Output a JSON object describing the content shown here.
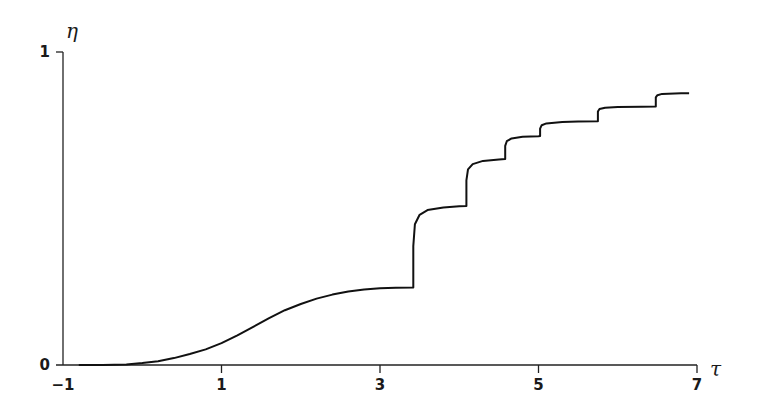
{
  "chart_data": {
    "type": "line",
    "title": "",
    "xlabel": "τ",
    "ylabel": "η",
    "xlim": [
      -1,
      7
    ],
    "ylim": [
      0,
      1
    ],
    "grid": false,
    "legend": null,
    "x_ticks": [
      -1,
      1,
      3,
      5,
      7
    ],
    "x_tick_labels": [
      "−1",
      "1",
      "3",
      "5",
      "7"
    ],
    "y_ticks": [
      0,
      1
    ],
    "y_tick_labels": [
      "0",
      "1"
    ],
    "series": [
      {
        "name": "η(τ)",
        "x": [
          -0.8,
          -0.5,
          -0.2,
          0.0,
          0.2,
          0.4,
          0.6,
          0.8,
          1.0,
          1.2,
          1.4,
          1.6,
          1.8,
          2.0,
          2.2,
          2.4,
          2.6,
          2.8,
          3.0,
          3.2,
          3.42,
          3.42,
          3.44,
          3.5,
          3.6,
          3.8,
          4.0,
          4.09,
          4.09,
          4.11,
          4.17,
          4.3,
          4.5,
          4.58,
          4.58,
          4.6,
          4.66,
          4.8,
          5.0,
          5.02,
          5.02,
          5.04,
          5.1,
          5.3,
          5.5,
          5.75,
          5.75,
          5.77,
          5.84,
          6.0,
          6.3,
          6.48,
          6.48,
          6.5,
          6.56,
          6.8,
          6.9
        ],
        "y": [
          0.0,
          0.0,
          0.002,
          0.006,
          0.012,
          0.022,
          0.035,
          0.05,
          0.07,
          0.095,
          0.122,
          0.15,
          0.175,
          0.195,
          0.212,
          0.225,
          0.235,
          0.241,
          0.245,
          0.247,
          0.248,
          0.38,
          0.45,
          0.48,
          0.495,
          0.503,
          0.507,
          0.508,
          0.59,
          0.625,
          0.642,
          0.652,
          0.657,
          0.658,
          0.7,
          0.715,
          0.724,
          0.729,
          0.731,
          0.732,
          0.755,
          0.766,
          0.772,
          0.776,
          0.778,
          0.779,
          0.81,
          0.818,
          0.822,
          0.824,
          0.825,
          0.826,
          0.855,
          0.862,
          0.866,
          0.868,
          0.868
        ]
      }
    ]
  },
  "axes": {
    "x_label": "τ",
    "y_label": "η"
  }
}
